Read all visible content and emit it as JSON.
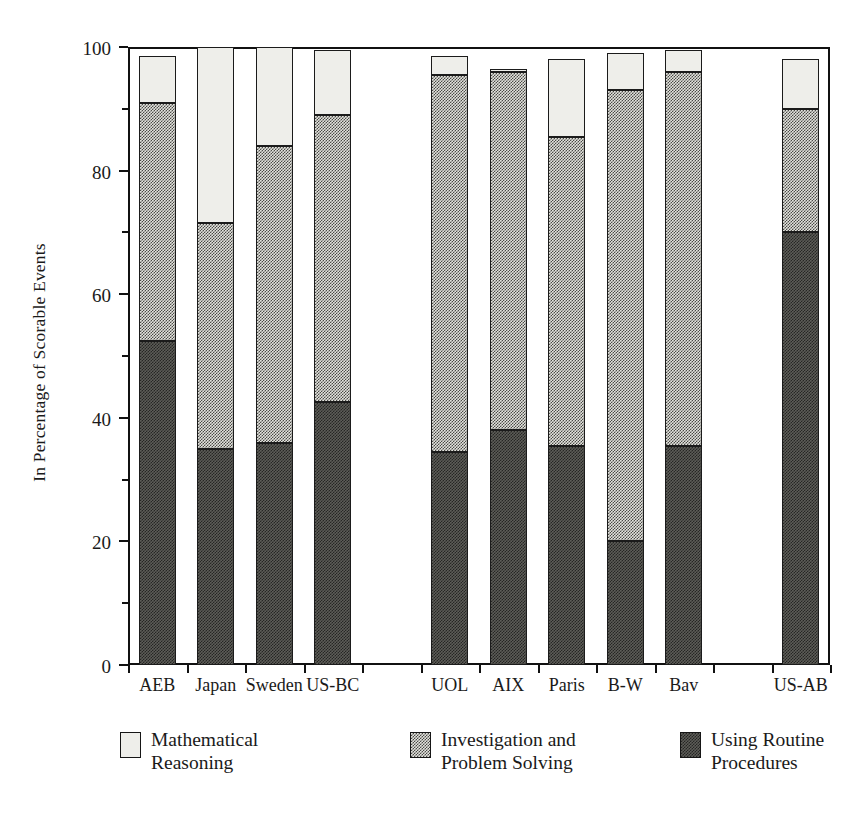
{
  "chart_data": {
    "type": "bar",
    "subtype": "stacked-bar",
    "title": "",
    "xlabel": "",
    "ylabel": "In Percentage of Scorable Events",
    "ylim": [
      0,
      100
    ],
    "yticks": [
      0,
      20,
      40,
      60,
      80,
      100
    ],
    "ytick_labels": [
      "0",
      "20",
      "40",
      "60",
      "80",
      "100"
    ],
    "yminor_ticks": [
      10,
      30,
      50,
      70,
      90
    ],
    "grid": false,
    "legend_position": "below-axes",
    "stack_order_bottom_to_top": [
      "Using Routine Procedures",
      "Investigation and Problem Solving",
      "Mathematical Reasoning"
    ],
    "categories": [
      "AEB",
      "Japan",
      "Sweden",
      "US-BC",
      "UOL",
      "AIX",
      "Paris",
      "B-W",
      "Bav",
      "US-AB"
    ],
    "series": [
      {
        "name": "Using Routine Procedures",
        "key": "routine",
        "values": [
          52.5,
          35.0,
          36.0,
          42.5,
          34.5,
          38.0,
          35.5,
          20.0,
          35.5,
          70.0
        ]
      },
      {
        "name": "Investigation and Problem Solving",
        "key": "investigation",
        "values": [
          38.5,
          36.5,
          48.0,
          46.5,
          61.0,
          58.0,
          50.0,
          73.0,
          60.5,
          20.0
        ]
      },
      {
        "name": "Mathematical Reasoning",
        "key": "reasoning",
        "values": [
          7.5,
          28.5,
          16.0,
          10.5,
          3.0,
          0.5,
          12.5,
          6.0,
          3.5,
          8.0
        ]
      }
    ],
    "cumulative_tops": {
      "routine": [
        52.5,
        35.0,
        36.0,
        42.5,
        34.5,
        38.0,
        35.5,
        20.0,
        35.5,
        70.0
      ],
      "investigation": [
        91.0,
        71.5,
        84.0,
        89.0,
        95.5,
        96.0,
        85.5,
        93.0,
        96.0,
        90.0
      ],
      "reasoning": [
        98.5,
        100.0,
        100.0,
        99.5,
        98.5,
        96.5,
        98.0,
        99.0,
        99.5,
        98.0
      ]
    }
  },
  "axis": {
    "y_title": "In Percentage of Scorable Events",
    "y_tick_labels": [
      "100",
      "80",
      "60",
      "40",
      "20",
      "0"
    ]
  },
  "x_categories": [
    {
      "label": "AEB",
      "slot": 0
    },
    {
      "label": "Japan",
      "slot": 1
    },
    {
      "label": "Sweden",
      "slot": 2
    },
    {
      "label": "US-BC",
      "slot": 3
    },
    {
      "label": "UOL",
      "slot": 5
    },
    {
      "label": "AIX",
      "slot": 6
    },
    {
      "label": "Paris",
      "slot": 7
    },
    {
      "label": "B-W",
      "slot": 8
    },
    {
      "label": "Bav",
      "slot": 9
    },
    {
      "label": "US-AB",
      "slot": 11
    }
  ],
  "legend": {
    "items": [
      {
        "label": "Mathematical\nReasoning",
        "swatch": "light-stipple-swatch",
        "color": "#eeeeea"
      },
      {
        "label": "Investigation and\nProblem Solving",
        "swatch": "medium-check-swatch",
        "color": "#c9c9c4"
      },
      {
        "label": "Using Routine\nProcedures",
        "swatch": "dark-check-swatch",
        "color": "#5d5d58"
      }
    ]
  },
  "colors": {
    "reasoning": "#eeeeea",
    "investigation": "#c9c9c4",
    "routine": "#5d5d58",
    "axis": "#111111",
    "background": "#ffffff"
  }
}
